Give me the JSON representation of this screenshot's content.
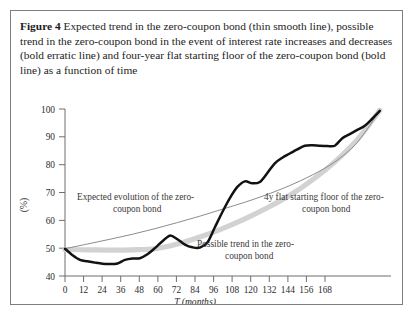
{
  "figure": {
    "label": "Figure 4",
    "caption": "Expected trend in the zero-coupon bond (thin smooth line), possible trend in the zero-coupon bond in the event of interest rate increases and decreases (bold erratic line) and four-year flat starting floor of the zero-coupon bond (bold line) as a function of time"
  },
  "annotations": {
    "expected": "Expected evolution of the zero-coupon bond",
    "floor": "4y flat starting floor of the zero-coupon bond",
    "possible": "Possible trend in the zero-coupon bond"
  },
  "colors": {
    "expected_line": "#8c8c8c",
    "floor_line": "#d2d2d2",
    "possible_line": "#121212",
    "axis": "#6e6e6e",
    "border": "#7d7d7d"
  },
  "chart_data": {
    "type": "line",
    "title": "",
    "xlabel": "T (months)",
    "ylabel": "(%)",
    "xlim": [
      0,
      174
    ],
    "ylim": [
      40,
      100
    ],
    "xticks": [
      0,
      12,
      24,
      36,
      48,
      60,
      72,
      84,
      96,
      108,
      120,
      132,
      144,
      156,
      168
    ],
    "yticks": [
      40,
      50,
      60,
      70,
      80,
      90,
      100
    ],
    "grid": false,
    "legend": "annotations-inline",
    "series": [
      {
        "name": "Expected evolution of the zero-coupon bond",
        "style": "thin smooth line",
        "color": "#8c8c8c",
        "x": [
          0,
          12,
          24,
          36,
          48,
          60,
          72,
          84,
          96,
          108,
          120,
          132,
          144,
          156,
          168
        ],
        "y": [
          49.8,
          51.5,
          53.2,
          55.0,
          57.0,
          59.2,
          61.5,
          64.0,
          66.5,
          69.3,
          72.5,
          76.3,
          81.0,
          88.0,
          99.5
        ]
      },
      {
        "name": "4y flat starting floor of the zero-coupon bond",
        "style": "bold grey line",
        "color": "#d2d2d2",
        "x": [
          0,
          12,
          24,
          36,
          48,
          60,
          72,
          84,
          96,
          108,
          120,
          132,
          144,
          156,
          168
        ],
        "y": [
          49.5,
          49.4,
          49.3,
          49.4,
          49.8,
          51.5,
          54.0,
          57.0,
          60.5,
          64.5,
          69.0,
          74.5,
          81.0,
          89.0,
          99.5
        ]
      },
      {
        "name": "Possible trend in the zero-coupon bond",
        "style": "bold erratic line",
        "color": "#121212",
        "x": [
          0,
          4,
          8,
          12,
          16,
          20,
          24,
          28,
          32,
          36,
          40,
          44,
          48,
          52,
          56,
          60,
          64,
          68,
          72,
          76,
          80,
          84,
          88,
          92,
          96,
          100,
          104,
          108,
          112,
          116,
          120,
          124,
          128,
          132,
          136,
          140,
          144,
          148,
          152,
          156,
          160,
          164,
          168
        ],
        "y": [
          49.8,
          47.5,
          45.8,
          45.3,
          44.8,
          44.4,
          44.3,
          44.5,
          45.8,
          46.3,
          46.4,
          47.8,
          50.0,
          52.5,
          54.5,
          53.2,
          51.3,
          50.3,
          50.2,
          52.0,
          57.5,
          63.0,
          68.0,
          72.0,
          74.0,
          73.3,
          73.8,
          77.0,
          80.5,
          82.5,
          84.0,
          85.5,
          86.8,
          87.0,
          86.8,
          86.7,
          86.8,
          89.5,
          91.0,
          92.5,
          94.0,
          96.5,
          99.3
        ]
      }
    ]
  }
}
